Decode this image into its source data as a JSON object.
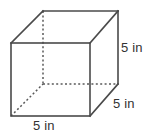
{
  "figure": {
    "name": "cube-diagram",
    "shape": "cube",
    "background_color": "#ffffff",
    "edge_color": "#4a4a4a",
    "hidden_edge_color": "#595959",
    "text_color": "#333333"
  },
  "labels": {
    "right_height": "5 in",
    "depth": "5 in",
    "bottom_width": "5 in"
  },
  "geometry": {
    "front_face": {
      "top_left": [
        11,
        43
      ],
      "top_right": [
        90,
        43
      ],
      "bottom_right": [
        90,
        116
      ],
      "bottom_left": [
        11,
        116
      ]
    },
    "back_face": {
      "top_left": [
        43,
        11
      ],
      "top_right": [
        118,
        11
      ],
      "bottom_right": [
        118,
        84
      ],
      "bottom_left": [
        43,
        84
      ]
    },
    "hidden_vertex": [
      43,
      84
    ]
  }
}
